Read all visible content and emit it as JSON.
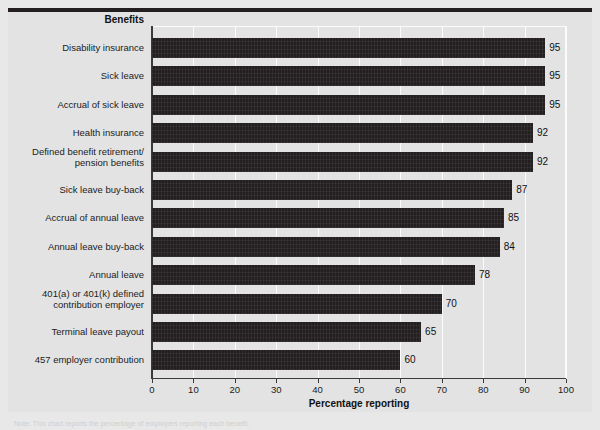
{
  "figure": {
    "row_header": "Benefits",
    "x_axis_title": "Percentage reporting",
    "footnote": "Note: This chart reports the percentage of employers reporting each benefit."
  },
  "chart_data": {
    "type": "bar",
    "orientation": "horizontal",
    "title": "",
    "xlabel": "Percentage reporting",
    "ylabel": "Benefits",
    "xlim": [
      0,
      100
    ],
    "xticks": [
      0,
      10,
      20,
      30,
      40,
      50,
      60,
      70,
      80,
      90,
      100
    ],
    "grid": "vertical",
    "legend": "none",
    "bar_color": "#231f20",
    "plot_background": "#e3e3e3",
    "categories": [
      "Disability insurance",
      "Sick leave",
      "Accrual of sick leave",
      "Health insurance",
      "Defined benefit retirement/\npension benefits",
      "Sick leave buy-back",
      "Accrual of annual leave",
      "Annual leave buy-back",
      "Annual leave",
      "401(a) or 401(k) defined\ncontribution employer",
      "Terminal leave payout",
      "457 employer contribution"
    ],
    "values": [
      95,
      95,
      95,
      92,
      92,
      87,
      85,
      84,
      78,
      70,
      65,
      60
    ],
    "data_labels": [
      "95",
      "95",
      "95",
      "92",
      "92",
      "87",
      "85",
      "84",
      "78",
      "70",
      "65",
      "60"
    ]
  }
}
